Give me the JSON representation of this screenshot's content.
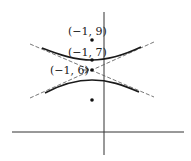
{
  "diagram": {
    "type": "hyperbola",
    "labels": {
      "focus_upper": "(−1, 9)",
      "vertex_upper": "(−1, 7)",
      "center": "(−1, 6)"
    },
    "points": [
      {
        "name": "focus-upper",
        "x": -1,
        "y": 9
      },
      {
        "name": "vertex-upper",
        "x": -1,
        "y": 7
      },
      {
        "name": "center",
        "x": -1,
        "y": 6
      },
      {
        "name": "focus-lower",
        "x": -1,
        "y": 3
      }
    ],
    "colors": {
      "curve": "#1a1a1a",
      "asymptote": "#555555",
      "axis": "#333333",
      "point": "#111111"
    }
  }
}
